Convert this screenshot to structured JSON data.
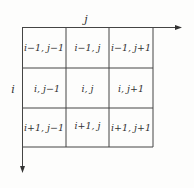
{
  "diagram": {
    "axis_labels": {
      "horizontal": "j",
      "vertical": "i"
    },
    "grid": {
      "rows": [
        [
          "i−1, j−1",
          "i−1, j",
          "i−1, j+1"
        ],
        [
          "i, j−1",
          "i, j",
          "i, j+1"
        ],
        [
          "i+1, j−1",
          "i+1, j",
          "i+1, j+1"
        ]
      ]
    },
    "colors": {
      "line": "#444444",
      "text": "#333333",
      "background": "#fdfdfc"
    }
  }
}
